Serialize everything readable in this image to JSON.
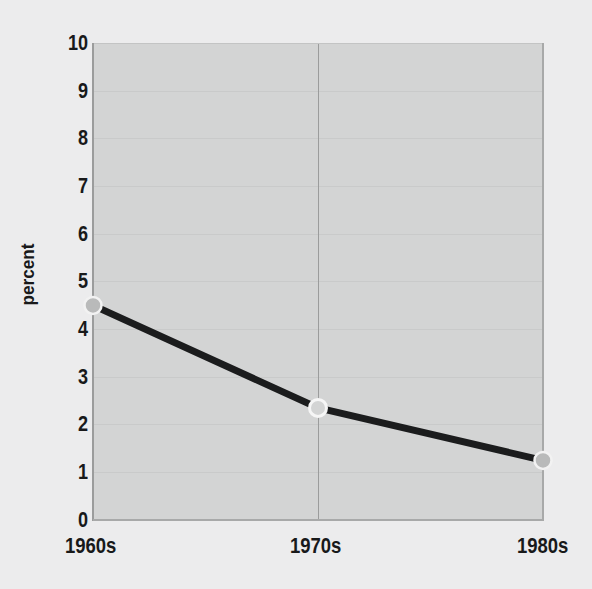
{
  "chart_data": {
    "type": "line",
    "title": "",
    "subtitle": "",
    "xlabel": "",
    "ylabel": "percent",
    "categories": [
      "1960s",
      "1970s",
      "1980s"
    ],
    "values": [
      4.5,
      2.35,
      1.25
    ],
    "series": [
      {
        "name": "percent",
        "values": [
          4.5,
          2.35,
          1.25
        ]
      }
    ],
    "ylim": [
      0,
      10
    ],
    "y_ticks": [
      0,
      1,
      2,
      3,
      4,
      5,
      6,
      7,
      8,
      9,
      10
    ],
    "y_tick_labels": [
      "0",
      "1",
      "2",
      "3",
      "4",
      "5",
      "6",
      "7",
      "8",
      "9",
      "10"
    ],
    "x_tick_labels": [
      "1960s",
      "1970s",
      "1980s"
    ],
    "grid": true,
    "grid_horizontal": true,
    "grid_vertical": true,
    "legend": false,
    "legend_position": "none",
    "markers": true,
    "marker_shape": "circle",
    "annotations": []
  },
  "style": {
    "figure_background": "#ececed",
    "plot_background": "#d3d4d4",
    "line_color": "#1b1c1d",
    "line_width": 7,
    "marker_fill": "#b9baba",
    "marker_edge": "#f2f2f2",
    "grid_color": "#c9caca",
    "vgrid_color": "#9b9c9c",
    "spine_color": "#9b9c9c",
    "text_color": "#18191a"
  },
  "axes": {
    "y_title": "percent",
    "tick_0": "0",
    "tick_1": "1",
    "tick_2": "2",
    "tick_3": "3",
    "tick_4": "4",
    "tick_5": "5",
    "tick_6": "6",
    "tick_7": "7",
    "tick_8": "8",
    "tick_9": "9",
    "tick_10": "10",
    "x_0": "1960s",
    "x_1": "1970s",
    "x_2": "1980s"
  }
}
